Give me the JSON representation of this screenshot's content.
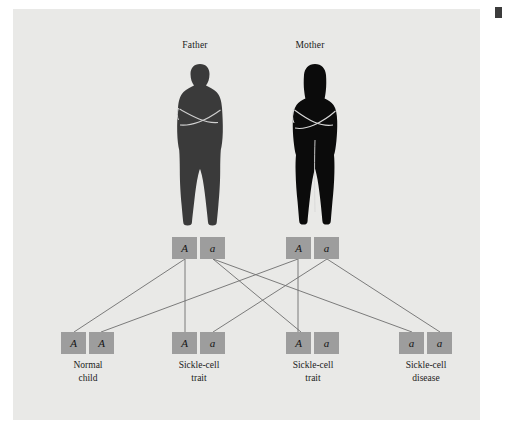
{
  "figure": {
    "background_color": "#e9e9e7",
    "page_color": "#ffffff",
    "corner_mark_color": "#3c3c3c"
  },
  "parents": [
    {
      "id": "father",
      "label": "Father",
      "silhouette_color": "#3a3a3a",
      "alleles": [
        "A",
        "a"
      ]
    },
    {
      "id": "mother",
      "label": "Mother",
      "silhouette_color": "#0b0b0b",
      "alleles": [
        "A",
        "a"
      ]
    }
  ],
  "children": [
    {
      "id": "child-1",
      "alleles": [
        "A",
        "A"
      ],
      "label_line1": "Normal",
      "label_line2": "child"
    },
    {
      "id": "child-2",
      "alleles": [
        "A",
        "a"
      ],
      "label_line1": "Sickle-cell",
      "label_line2": "trait"
    },
    {
      "id": "child-3",
      "alleles": [
        "A",
        "a"
      ],
      "label_line1": "Sickle-cell",
      "label_line2": "trait"
    },
    {
      "id": "child-4",
      "alleles": [
        "a",
        "a"
      ],
      "label_line1": "Sickle-cell",
      "label_line2": "disease"
    }
  ],
  "allele_box": {
    "fill_color": "#9d9d9d",
    "text_color": "#141414"
  },
  "links": {
    "stroke_color": "#6e6e6e",
    "stroke_width": 0.9
  }
}
